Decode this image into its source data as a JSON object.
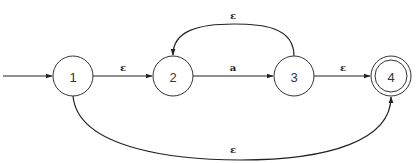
{
  "diagram": {
    "type": "nfa-state-diagram",
    "colors": {
      "stroke": "#333333",
      "background": "#ffffff"
    },
    "start_state": "1",
    "accept_states": [
      "4"
    ],
    "states": [
      {
        "id": "1",
        "label": "1",
        "cx": 73,
        "cy": 76,
        "r": 20,
        "accepting": false
      },
      {
        "id": "2",
        "label": "2",
        "cx": 173,
        "cy": 76,
        "r": 20,
        "accepting": false
      },
      {
        "id": "3",
        "label": "3",
        "cx": 294,
        "cy": 76,
        "r": 20,
        "accepting": false
      },
      {
        "id": "4",
        "label": "4",
        "cx": 391,
        "cy": 76,
        "r": 20,
        "accepting": true
      }
    ],
    "transitions": [
      {
        "from": "1",
        "to": "2",
        "label": "ε"
      },
      {
        "from": "2",
        "to": "3",
        "label": "a"
      },
      {
        "from": "3",
        "to": "4",
        "label": "ε"
      },
      {
        "from": "3",
        "to": "2",
        "label": "ε"
      },
      {
        "from": "1",
        "to": "4",
        "label": "ε"
      }
    ]
  }
}
